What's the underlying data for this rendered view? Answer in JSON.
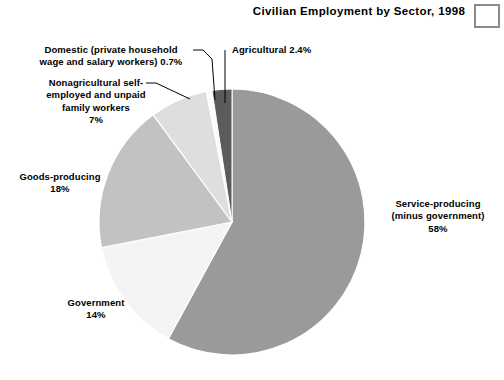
{
  "title": "Civilian Employment by Sector, 1998",
  "corner_box": {
    "name": "corner-box"
  },
  "chart_data": {
    "type": "pie",
    "title": "Civilian Employment by Sector, 1998",
    "xlabel": "",
    "ylabel": "",
    "grid": false,
    "legend": "none",
    "units": "percent of civilian employment",
    "start_angle_deg": 0,
    "direction": "clockwise",
    "labels": [
      "Service-producing (minus government)",
      "Government",
      "Goods-producing",
      "Nonagricultural self-employed and unpaid family workers",
      "Domestic (private household wage and salary workers)",
      "Agricultural"
    ],
    "values": [
      58,
      14,
      18,
      7,
      0.7,
      2.4
    ],
    "colors": [
      "#9a9a9a",
      "#f4f4f4",
      "#c2c2c2",
      "#dedede",
      "#fbfbfb",
      "#5b5b5b"
    ],
    "slices": [
      {
        "name": "service-producing",
        "label_line_1": "Service-producing",
        "label_line_2": "(minus government)",
        "label_line_3": "58%",
        "value": 58,
        "value_text": "58%",
        "color": "#9a9a9a"
      },
      {
        "name": "government",
        "label_line_1": "Government",
        "label_line_2": "14%",
        "value": 14,
        "value_text": "14%",
        "color": "#f4f4f4"
      },
      {
        "name": "goods-producing",
        "label_line_1": "Goods-producing",
        "label_line_2": "18%",
        "value": 18,
        "value_text": "18%",
        "color": "#c2c2c2"
      },
      {
        "name": "nonagricultural-self-employed",
        "label_line_1": "Nonagricultural self-",
        "label_line_2": "employed and unpaid",
        "label_line_3": "family workers",
        "label_line_4": "7%",
        "value": 7,
        "value_text": "7%",
        "color": "#dedede"
      },
      {
        "name": "domestic",
        "label_line_1": "Domestic (private household",
        "label_line_2": "wage and salary workers) 0.7%",
        "value": 0.7,
        "value_text": "0.7%",
        "color": "#fbfbfb"
      },
      {
        "name": "agricultural",
        "label_line_1": "Agricultural 2.4%",
        "value": 2.4,
        "value_text": "2.4%",
        "color": "#5b5b5b"
      }
    ]
  }
}
